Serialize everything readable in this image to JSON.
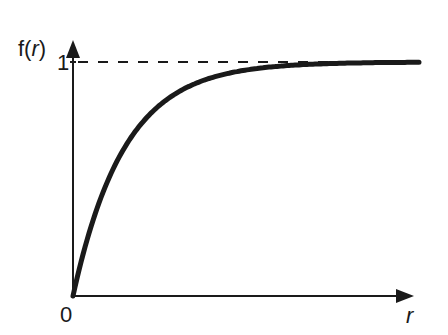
{
  "figure": {
    "y_label_prefix": "f(",
    "y_label_var": "r",
    "y_label_suffix": ")",
    "x_label": "r",
    "origin_label": "0",
    "y_tick_label": "1",
    "colors": {
      "ink": "#1a1a1a",
      "background": "#ffffff"
    }
  },
  "chart_data": {
    "type": "line",
    "title": "",
    "xlabel": "r",
    "ylabel": "f(r)",
    "asymptote": 1,
    "asymptote_style": "dashed",
    "x_ticks": [
      "0"
    ],
    "y_ticks": [
      "1"
    ],
    "ylim": [
      0,
      1
    ],
    "grid": false,
    "legend": null,
    "series": [
      {
        "name": "f(r)",
        "x": [
          0,
          0.5,
          1,
          1.5,
          2,
          3,
          4,
          5
        ],
        "values": [
          0,
          0.42,
          0.67,
          0.81,
          0.89,
          0.96,
          0.985,
          0.995
        ]
      }
    ]
  }
}
